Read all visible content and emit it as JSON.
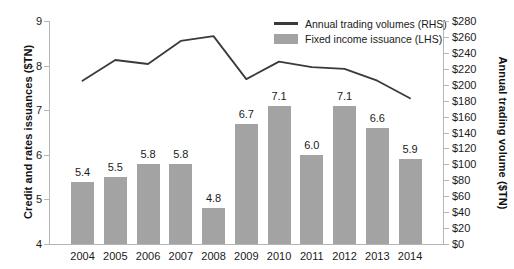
{
  "chart_data": {
    "type": "bar",
    "title": "",
    "xlabel": "",
    "ylabel": "Credit and rates issuances ($TN)",
    "y2label": "Annual trading volume ($TN)",
    "categories": [
      "2004",
      "2005",
      "2006",
      "2007",
      "2008",
      "2009",
      "2010",
      "2011",
      "2012",
      "2013",
      "2014"
    ],
    "ylim": [
      4,
      9
    ],
    "y2lim": [
      0,
      280
    ],
    "y_ticks": [
      "4",
      "5",
      "6",
      "7",
      "8",
      "9"
    ],
    "y2_ticks": [
      "$0",
      "$20",
      "$40",
      "$60",
      "$80",
      "$100",
      "$120",
      "$140",
      "$160",
      "$180",
      "$200",
      "$220",
      "$240",
      "$260",
      "$280"
    ],
    "grid": false,
    "legend_position": "top-right",
    "series": [
      {
        "name": "Fixed income issuance (LHS)",
        "type": "bar",
        "axis": "left",
        "color": "#a3a3a3",
        "values": [
          5.4,
          5.5,
          5.8,
          5.8,
          4.8,
          6.7,
          7.1,
          6.0,
          7.1,
          6.6,
          5.9
        ],
        "labels": [
          "5.4",
          "5.5",
          "5.8",
          "5.8",
          "4.8",
          "6.7",
          "7.1",
          "6.0",
          "7.1",
          "6.6",
          "5.9"
        ]
      },
      {
        "name": "Annual trading volumes (RHS)",
        "type": "line",
        "axis": "right",
        "color": "#3a3a3a",
        "values": [
          205,
          231,
          226,
          255,
          261,
          207,
          229,
          222,
          220,
          205,
          183
        ]
      }
    ],
    "annotations": []
  },
  "legend": {
    "items": [
      {
        "label": "Annual trading volumes (RHS)",
        "marker": "line"
      },
      {
        "label": "Fixed income issuance (LHS)",
        "marker": "bar"
      }
    ]
  }
}
